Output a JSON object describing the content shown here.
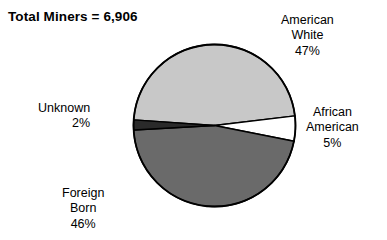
{
  "title": "Total Miners = 6,906",
  "background_color": "#ffffff",
  "outline_color": "#000000",
  "labels": {
    "american_white": {
      "line1": "American",
      "line2": "White",
      "percent": "47%"
    },
    "african_american": {
      "line1": "African",
      "line2": "American",
      "percent": "5%"
    },
    "unknown": {
      "line1": "Unknown",
      "percent": "2%"
    },
    "foreign_born": {
      "line1": "Foreign",
      "line2": "Born",
      "percent": "46%"
    }
  },
  "chart_data": {
    "type": "pie",
    "title": "Total Miners = 6,906",
    "total": 6906,
    "total_label": "Total Miners",
    "xlabel": "",
    "ylabel": "",
    "legend_position": "none",
    "labels_placement": "outside",
    "grid": false,
    "categories": [
      "American White",
      "African American",
      "Foreign Born",
      "Unknown"
    ],
    "values": [
      47,
      5,
      46,
      2
    ],
    "value_unit": "percent",
    "display_values": [
      "47%",
      "5%",
      "46%",
      "2%"
    ],
    "colors": [
      "#c8c8c8",
      "#ffffff",
      "#6a6a6a",
      "#2a2a2a"
    ],
    "slices": [
      {
        "name": "American White",
        "percent": 47,
        "display": "47%",
        "color": "#c8c8c8",
        "start_angle_deg": 184,
        "end_angle_deg": 353.2
      },
      {
        "name": "African American",
        "percent": 5,
        "display": "5%",
        "color": "#ffffff",
        "start_angle_deg": 353.2,
        "end_angle_deg": 371.2
      },
      {
        "name": "Foreign Born",
        "percent": 46,
        "display": "46%",
        "color": "#6a6a6a",
        "start_angle_deg": 371.2,
        "end_angle_deg": 536.8
      },
      {
        "name": "Unknown",
        "percent": 2,
        "display": "2%",
        "color": "#2a2a2a",
        "start_angle_deg": 536.8,
        "end_angle_deg": 544.0
      }
    ],
    "center": {
      "x": 214.5,
      "y": 125.5
    },
    "radius": 81
  }
}
